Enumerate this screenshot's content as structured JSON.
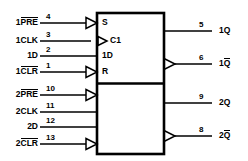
{
  "diagram": {
    "line_color": "#000000",
    "background_color": "#ffffff"
  },
  "sections": [
    {
      "name": "flip-flop-1",
      "inputs": [
        {
          "name": "preset-1",
          "label_plain": "1PRE",
          "label_prefix": "1",
          "label_overbar": "PRE",
          "pin": "4",
          "inner": "S",
          "negated": true
        },
        {
          "name": "clock-1",
          "label_plain": "1CLK",
          "label_prefix": "1CLK",
          "label_overbar": "",
          "pin": "3",
          "inner": "C1",
          "negated": false,
          "dynamic": true
        },
        {
          "name": "data-1",
          "label_plain": "1D",
          "label_prefix": "1D",
          "label_overbar": "",
          "pin": "2",
          "inner": "1D",
          "negated": false
        },
        {
          "name": "clear-1",
          "label_plain": "1CLR",
          "label_prefix": "1",
          "label_overbar": "CLR",
          "pin": "1",
          "inner": "R",
          "negated": true
        }
      ],
      "outputs": [
        {
          "name": "q-1",
          "label_prefix": "1",
          "label_overbar": "",
          "label_suffix": "Q",
          "pin": "5",
          "negated": false
        },
        {
          "name": "qbar-1",
          "label_prefix": "1",
          "label_overbar": "Q",
          "label_suffix": "",
          "pin": "6",
          "negated": true
        }
      ]
    },
    {
      "name": "flip-flop-2",
      "inputs": [
        {
          "name": "preset-2",
          "label_plain": "2PRE",
          "label_prefix": "2",
          "label_overbar": "PRE",
          "pin": "10",
          "inner": "",
          "negated": true
        },
        {
          "name": "clock-2",
          "label_plain": "2CLK",
          "label_prefix": "2CLK",
          "label_overbar": "",
          "pin": "11",
          "inner": "",
          "negated": false
        },
        {
          "name": "data-2",
          "label_plain": "2D",
          "label_prefix": "2D",
          "label_overbar": "",
          "pin": "12",
          "inner": "",
          "negated": false
        },
        {
          "name": "clear-2",
          "label_plain": "2CLR",
          "label_prefix": "2",
          "label_overbar": "CLR",
          "pin": "13",
          "inner": "",
          "negated": true
        }
      ],
      "outputs": [
        {
          "name": "q-2",
          "label_prefix": "2",
          "label_overbar": "",
          "label_suffix": "Q",
          "pin": "9",
          "negated": false
        },
        {
          "name": "qbar-2",
          "label_prefix": "2",
          "label_overbar": "Q",
          "label_suffix": "",
          "pin": "8",
          "negated": true
        }
      ]
    }
  ]
}
